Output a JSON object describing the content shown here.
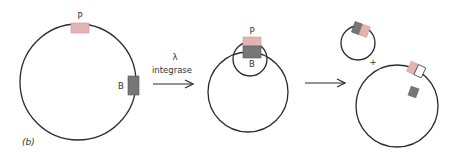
{
  "figure": {
    "panel_label": "(b)",
    "colors": {
      "line": "#2b2b2b",
      "P_site": "#e2b3b3",
      "B_site": "#777777",
      "empty_site": "#ffffff"
    },
    "stage1": {
      "description": "Circular DNA with P and B attachment sites",
      "P_label": "P",
      "B_label": "B"
    },
    "arrow1": {
      "label_top": "λ",
      "label_bottom": "integrase"
    },
    "stage2": {
      "description": "P and B sites aligned, forming a loop",
      "P_label": "P",
      "B_label": "B"
    },
    "arrow2": {},
    "stage3": {
      "description": "Excised small circle plus large circle",
      "plus": "+"
    }
  }
}
